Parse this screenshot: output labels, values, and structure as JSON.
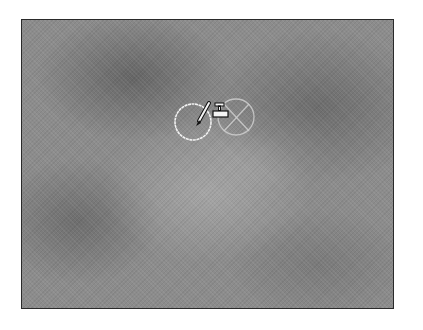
{
  "canvas": {
    "description": "grayscale clouds texture",
    "base_color": "#8c8c8c",
    "border_color": "#2a2a2a"
  },
  "cursor": {
    "tool": "clone-stamp",
    "source_circle": {
      "cx": 193,
      "cy": 122,
      "r": 18,
      "color": "#ffffff"
    },
    "target_circle": {
      "cx": 236,
      "cy": 117,
      "r": 18,
      "color": "#c8c8c8"
    },
    "icons": [
      "brush-icon",
      "stamp-icon",
      "crosshair-x-icon"
    ]
  }
}
